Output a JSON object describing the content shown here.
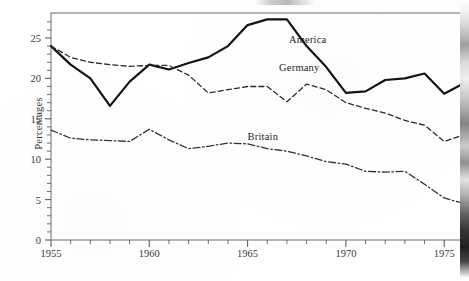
{
  "chart_data": {
    "type": "line",
    "title": "",
    "subtitle": "",
    "xlabel": "",
    "ylabel": "Percentages",
    "xlim": [
      1955,
      1976
    ],
    "ylim": [
      0,
      27.5
    ],
    "grid": false,
    "legend_position": "inline-annotations",
    "y_ticks": [
      0,
      5,
      10,
      15,
      20,
      25
    ],
    "y_tick_labels": [
      "0",
      "5",
      "10",
      "15",
      "20",
      "25"
    ],
    "y_minor_tick_step": 1,
    "x_ticks": [
      1955,
      1960,
      1965,
      1970,
      1975
    ],
    "x_tick_labels": [
      "1955",
      "1960",
      "1965",
      "1970",
      "1975"
    ],
    "x_minor_tick_step": 1,
    "x": [
      1955,
      1956,
      1957,
      1958,
      1959,
      1960,
      1961,
      1962,
      1963,
      1964,
      1965,
      1966,
      1967,
      1968,
      1969,
      1970,
      1971,
      1972,
      1973,
      1974,
      1975,
      1976
    ],
    "series": [
      {
        "name": "America",
        "style": "solid",
        "color": "#141414",
        "width": 2.2,
        "label_x": 1967.1,
        "label_y": 24.6,
        "values": [
          24.0,
          21.7,
          20.0,
          16.6,
          19.6,
          21.7,
          21.1,
          21.9,
          22.6,
          24.0,
          26.6,
          27.3,
          27.3,
          24.0,
          21.4,
          18.2,
          18.4,
          19.8,
          20.0,
          20.6,
          18.1,
          19.4
        ]
      },
      {
        "name": "Germany",
        "style": "dashed",
        "color": "#2b2b2b",
        "width": 1.3,
        "label_x": 1966.6,
        "label_y": 21.2,
        "values": [
          24.0,
          22.6,
          22.0,
          21.7,
          21.5,
          21.6,
          21.6,
          20.4,
          18.2,
          18.6,
          19.0,
          19.0,
          17.1,
          19.3,
          18.6,
          17.0,
          16.3,
          15.7,
          14.8,
          14.2,
          12.2,
          13.0
        ]
      },
      {
        "name": "Britain",
        "style": "dashdot",
        "color": "#333333",
        "width": 1.3,
        "label_x": 1965.0,
        "label_y": 12.6,
        "values": [
          13.6,
          12.6,
          12.4,
          12.3,
          12.2,
          13.7,
          12.4,
          11.3,
          11.6,
          12.0,
          11.9,
          11.3,
          11.0,
          10.4,
          9.7,
          9.4,
          8.5,
          8.4,
          8.5,
          6.9,
          5.2,
          4.5
        ]
      }
    ]
  },
  "axes": {
    "y_axis_title": "Percentages"
  },
  "figure": {
    "plot_left": 51,
    "plot_right": 462,
    "plot_top": 13,
    "plot_bottom": 240
  }
}
